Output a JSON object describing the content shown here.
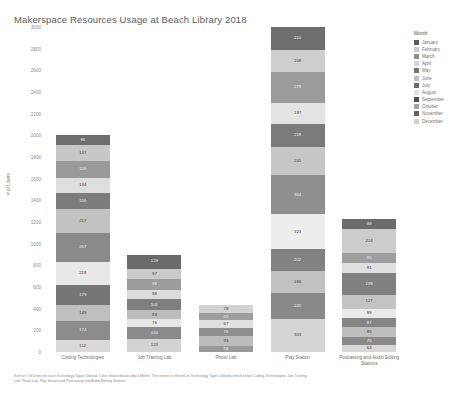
{
  "title": "Makerspace Resources Usage at Beach Library 2018",
  "axis": {
    "ylabel": "# of Users",
    "yticks": [
      "3000",
      "2800",
      "2600",
      "2400",
      "2200",
      "2000",
      "1800",
      "1600",
      "1400",
      "1200",
      "1000",
      "800",
      "600",
      "400",
      "200",
      "0"
    ]
  },
  "legend": {
    "title": "Month",
    "items": [
      {
        "label": "January",
        "color": "#5b5b5b"
      },
      {
        "label": "February",
        "color": "#c9c9c9"
      },
      {
        "label": "March",
        "color": "#8e8e8e"
      },
      {
        "label": "April",
        "color": "#d6d6d6"
      },
      {
        "label": "May",
        "color": "#757575"
      },
      {
        "label": "June",
        "color": "#bdbdbd"
      },
      {
        "label": "July",
        "color": "#6a6a6a"
      },
      {
        "label": "August",
        "color": "#e2e2e2"
      },
      {
        "label": "September",
        "color": "#4f4f4f"
      },
      {
        "label": "October",
        "color": "#a5a5a5"
      },
      {
        "label": "November",
        "color": "#646464"
      },
      {
        "label": "December",
        "color": "#cfcfcf"
      }
    ]
  },
  "caption": "Sum of # of Users for each Technology Types Utilized.  Color shows details about Month.  The context is filtered on Technology Types Utilized, which keeps Coding Technologies, Job Training Lab, Photo Lab, Play Station and Podcasting and Audio Editing Stations.",
  "chart_data": {
    "type": "bar",
    "subtype": "stacked",
    "title": "Makerspace Resources Usage at Beach Library 2018",
    "xlabel": "",
    "ylabel": "# of Users",
    "ylim": [
      0,
      3000
    ],
    "ytick_step": 200,
    "grid": false,
    "legend_position": "right",
    "legend_title": "Month",
    "categories": [
      "Coding Technologies",
      "Job Training Lab",
      "Photo Lab",
      "Play Station",
      "Podcasting and Audio Editing Stations"
    ],
    "series": [
      {
        "name": "January",
        "color": "#5b5b5b",
        "values": [
          112,
          123,
          56,
          303,
          64
        ]
      },
      {
        "name": "February",
        "color": "#c9c9c9",
        "values": [
          174,
          104,
          93,
          245,
          76
        ]
      },
      {
        "name": "March",
        "color": "#8e8e8e",
        "values": [
          149,
          76,
          76,
          196,
          86
        ]
      },
      {
        "name": "April",
        "color": "#d6d6d6",
        "values": [
          179,
          83,
          67,
          202,
          87
        ]
      },
      {
        "name": "May",
        "color": "#757575",
        "values": [
          218,
          101,
          65,
          323,
          88
        ]
      },
      {
        "name": "June",
        "color": "#bdbdbd",
        "values": [
          267,
          88,
          78,
          364,
          127
        ]
      },
      {
        "name": "July",
        "color": "#6a6a6a",
        "values": [
          217,
          98,
          0,
          255,
          199
        ]
      },
      {
        "name": "August",
        "color": "#e2e2e2",
        "values": [
          156,
          97,
          0,
          218,
          91
        ]
      },
      {
        "name": "September",
        "color": "#4f4f4f",
        "values": [
          134,
          129,
          0,
          197,
          95
        ]
      },
      {
        "name": "October",
        "color": "#a5a5a5",
        "values": [
          158,
          0,
          0,
          279,
          224
        ]
      },
      {
        "name": "November",
        "color": "#646464",
        "values": [
          147,
          0,
          0,
          208,
          88
        ]
      },
      {
        "name": "December",
        "color": "#cfcfcf",
        "values": [
          96,
          0,
          0,
          210,
          0
        ]
      }
    ],
    "bars": [
      {
        "category": "Coding Technologies",
        "total": 2007,
        "segments": [
          {
            "month": "December",
            "value": 96,
            "color": "#6e6e6e",
            "dark": true
          },
          {
            "month": "November",
            "value": 147,
            "color": "#c7c7c7",
            "dark": false
          },
          {
            "month": "October",
            "value": 158,
            "color": "#9a9a9a",
            "dark": true
          },
          {
            "month": "September",
            "value": 134,
            "color": "#dedede",
            "dark": false
          },
          {
            "month": "August",
            "value": 156,
            "color": "#7c7c7c",
            "dark": true
          },
          {
            "month": "July",
            "value": 217,
            "color": "#c2c2c2",
            "dark": false
          },
          {
            "month": "June",
            "value": 267,
            "color": "#8a8a8a",
            "dark": true
          },
          {
            "month": "May",
            "value": 218,
            "color": "#e8e8e8",
            "dark": false
          },
          {
            "month": "April",
            "value": 179,
            "color": "#767676",
            "dark": true
          },
          {
            "month": "March",
            "value": 149,
            "color": "#bfbfbf",
            "dark": false
          },
          {
            "month": "February",
            "value": 174,
            "color": "#8c8c8c",
            "dark": true
          },
          {
            "month": "January",
            "value": 112,
            "color": "#d9d9d9",
            "dark": false
          }
        ]
      },
      {
        "category": "Job Training Lab",
        "total": 899,
        "segments": [
          {
            "month": "September",
            "value": 129,
            "color": "#6b6b6b",
            "dark": true
          },
          {
            "month": "August",
            "value": 97,
            "color": "#cacaca",
            "dark": false
          },
          {
            "month": "July",
            "value": 98,
            "color": "#9c9c9c",
            "dark": true
          },
          {
            "month": "June",
            "value": 88,
            "color": "#dcdcdc",
            "dark": false
          },
          {
            "month": "May",
            "value": 101,
            "color": "#7f7f7f",
            "dark": true
          },
          {
            "month": "April",
            "value": 83,
            "color": "#bdbdbd",
            "dark": false
          },
          {
            "month": "March",
            "value": 76,
            "color": "#e6e6e6",
            "dark": false
          },
          {
            "month": "February",
            "value": 104,
            "color": "#8b8b8b",
            "dark": true
          },
          {
            "month": "January",
            "value": 123,
            "color": "#d3d3d3",
            "dark": false
          }
        ]
      },
      {
        "category": "Photo Lab",
        "total": 435,
        "segments": [
          {
            "month": "June",
            "value": 78,
            "color": "#d2d2d2",
            "dark": false
          },
          {
            "month": "May",
            "value": 65,
            "color": "#9d9d9d",
            "dark": true
          },
          {
            "month": "April",
            "value": 67,
            "color": "#e0e0e0",
            "dark": false
          },
          {
            "month": "March",
            "value": 76,
            "color": "#8d8d8d",
            "dark": true
          },
          {
            "month": "February",
            "value": 93,
            "color": "#bcbcbc",
            "dark": false
          },
          {
            "month": "January",
            "value": 56,
            "color": "#9a9a9a",
            "dark": true
          }
        ]
      },
      {
        "category": "Play Station",
        "total": 2800,
        "segments": [
          {
            "month": "December",
            "value": 210,
            "color": "#6e6e6e",
            "dark": true
          },
          {
            "month": "November",
            "value": 208,
            "color": "#cecece",
            "dark": false
          },
          {
            "month": "October",
            "value": 279,
            "color": "#9b9b9b",
            "dark": true
          },
          {
            "month": "September",
            "value": 197,
            "color": "#e3e3e3",
            "dark": false
          },
          {
            "month": "August",
            "value": 218,
            "color": "#7b7b7b",
            "dark": true
          },
          {
            "month": "July",
            "value": 255,
            "color": "#c6c6c6",
            "dark": false
          },
          {
            "month": "June",
            "value": 364,
            "color": "#8f8f8f",
            "dark": true
          },
          {
            "month": "May",
            "value": 323,
            "color": "#ededed",
            "dark": false
          },
          {
            "month": "April",
            "value": 202,
            "color": "#828282",
            "dark": true
          },
          {
            "month": "March",
            "value": 196,
            "color": "#c1c1c1",
            "dark": false
          },
          {
            "month": "February",
            "value": 245,
            "color": "#898989",
            "dark": true
          },
          {
            "month": "January",
            "value": 303,
            "color": "#d5d5d5",
            "dark": false
          }
        ]
      },
      {
        "category": "Podcasting and Audio Editing Stations",
        "total": 1025,
        "segments": [
          {
            "month": "November",
            "value": 88,
            "color": "#6c6c6c",
            "dark": true
          },
          {
            "month": "October",
            "value": 224,
            "color": "#cccccc",
            "dark": false
          },
          {
            "month": "September",
            "value": 95,
            "color": "#9e9e9e",
            "dark": true
          },
          {
            "month": "August",
            "value": 91,
            "color": "#dfdfdf",
            "dark": false
          },
          {
            "month": "July",
            "value": 199,
            "color": "#808080",
            "dark": true
          },
          {
            "month": "June",
            "value": 127,
            "color": "#c3c3c3",
            "dark": false
          },
          {
            "month": "May",
            "value": 88,
            "color": "#e9e9e9",
            "dark": false
          },
          {
            "month": "April",
            "value": 87,
            "color": "#858585",
            "dark": true
          },
          {
            "month": "March",
            "value": 86,
            "color": "#bebebe",
            "dark": false
          },
          {
            "month": "February",
            "value": 76,
            "color": "#8a8a8a",
            "dark": true
          },
          {
            "month": "January",
            "value": 64,
            "color": "#d7d7d7",
            "dark": false
          }
        ]
      }
    ]
  }
}
